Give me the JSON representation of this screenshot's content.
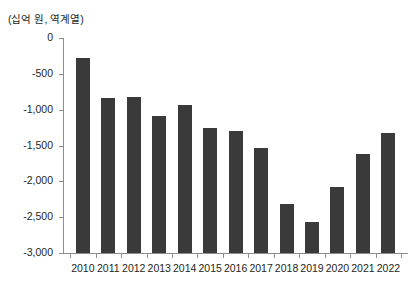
{
  "figure": {
    "top_clipped_text": "",
    "unit_label": "(십억 원, 역계열)",
    "bar_color": "#3a3a3a",
    "axis_color": "#8d8d8d",
    "text_color": "#231f20"
  },
  "chart_data": {
    "type": "bar",
    "title": "",
    "subtitle": "",
    "xlabel": "",
    "ylabel": "(십억 원, 역계열)",
    "categories": [
      "2010",
      "2011",
      "2012",
      "2013",
      "2014",
      "2015",
      "2016",
      "2017",
      "2018",
      "2019",
      "2020",
      "2021",
      "2022"
    ],
    "values": [
      -280,
      -840,
      -830,
      -1090,
      -940,
      -1250,
      -1300,
      -1540,
      -2310,
      -2570,
      -2080,
      -1620,
      -1320
    ],
    "series": [
      {
        "name": "",
        "values": [
          -280,
          -840,
          -830,
          -1090,
          -940,
          -1250,
          -1300,
          -1540,
          -2310,
          -2570,
          -2080,
          -1620,
          -1320
        ]
      }
    ],
    "ylim": [
      0,
      -3000
    ],
    "y_inverted": true,
    "yticks": [
      0,
      -500,
      -1000,
      -1500,
      -2000,
      -2500,
      -3000
    ],
    "ytick_labels": [
      "0",
      "-500",
      "-1,000",
      "-1,500",
      "-2,000",
      "-2,500",
      "-3,000"
    ],
    "grid": false,
    "legend": null,
    "legend_position": "none",
    "annotations": []
  }
}
